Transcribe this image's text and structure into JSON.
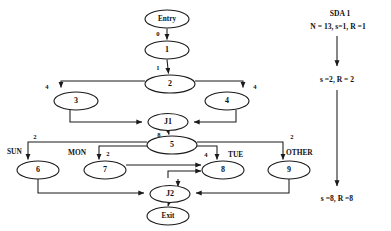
{
  "diagram": {
    "nodes": [
      {
        "id": "entry",
        "label": "Entry",
        "cx": 167,
        "cy": 19,
        "rx": 22,
        "ry": 9
      },
      {
        "id": "n1",
        "label": "1",
        "cx": 167,
        "cy": 50,
        "rx": 22,
        "ry": 9
      },
      {
        "id": "n2",
        "label": "2",
        "cx": 170,
        "cy": 84,
        "rx": 25,
        "ry": 9
      },
      {
        "id": "n3",
        "label": "3",
        "cx": 76,
        "cy": 101,
        "rx": 22,
        "ry": 9
      },
      {
        "id": "n4",
        "label": "4",
        "cx": 227,
        "cy": 101,
        "rx": 22,
        "ry": 9
      },
      {
        "id": "j1",
        "label": "J1",
        "cx": 168,
        "cy": 122,
        "rx": 20,
        "ry": 8.5
      },
      {
        "id": "n5",
        "label": "5",
        "cx": 172,
        "cy": 145,
        "rx": 25,
        "ry": 9
      },
      {
        "id": "n6",
        "label": "6",
        "cx": 38,
        "cy": 170,
        "rx": 21,
        "ry": 9
      },
      {
        "id": "n7",
        "label": "7",
        "cx": 105,
        "cy": 170,
        "rx": 21,
        "ry": 9
      },
      {
        "id": "n8",
        "label": "8",
        "cx": 223,
        "cy": 170,
        "rx": 21,
        "ry": 9
      },
      {
        "id": "n9",
        "label": "9",
        "cx": 289,
        "cy": 170,
        "rx": 21,
        "ry": 9
      },
      {
        "id": "j2",
        "label": "J2",
        "cx": 170,
        "cy": 194,
        "rx": 20,
        "ry": 8.5
      },
      {
        "id": "exit",
        "label": "Exit",
        "cx": 168,
        "cy": 216,
        "rx": 21,
        "ry": 9
      }
    ],
    "edge_labels": [
      {
        "id": "entry-to-1",
        "text": "0",
        "x": 158,
        "y": 34
      },
      {
        "id": "one-to-2",
        "text": "1",
        "x": 158,
        "y": 68
      },
      {
        "id": "two-to-3",
        "text": "4",
        "x": 47,
        "y": 87
      },
      {
        "id": "two-to-4",
        "text": "4",
        "x": 255,
        "y": 87
      },
      {
        "id": "j1-to-5",
        "text": "8",
        "x": 159,
        "y": 135
      },
      {
        "id": "five-to-6",
        "text": "2",
        "x": 42,
        "y": 137
      },
      {
        "id": "five-to-7",
        "text": "2",
        "x": 106,
        "y": 154
      },
      {
        "id": "five-to-8",
        "text": "4",
        "x": 205,
        "y": 155
      },
      {
        "id": "five-to-9",
        "text": "2",
        "x": 296,
        "y": 139
      }
    ],
    "branch_labels": [
      {
        "id": "sun",
        "text": "SUN",
        "x": 9,
        "y": 152
      },
      {
        "id": "mon",
        "text": "MON",
        "x": 74,
        "y": 153
      },
      {
        "id": "tue",
        "text": "TUE",
        "x": 236,
        "y": 155
      },
      {
        "id": "other",
        "text": "OTHER",
        "x": 290,
        "y": 153
      }
    ],
    "side_panel": {
      "title": "SDA 1",
      "line1": "N = 13, s=1, R =1",
      "line2": "s =2, R = 2",
      "line3": "s =8, R =8",
      "title_x": 340,
      "title_y": 14,
      "line1_x": 338,
      "line1_y": 26,
      "line2_x": 337,
      "line2_y": 80,
      "line3_x": 337,
      "line3_y": 199
    },
    "colors": {
      "stroke": "#1a1a1a",
      "text": "#111111",
      "background": "#ffffff"
    }
  }
}
